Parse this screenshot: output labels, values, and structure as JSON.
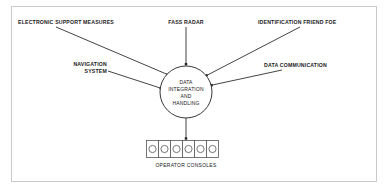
{
  "frame": {
    "border_color": "#c9c9c9",
    "background": "#ffffff"
  },
  "diagram": {
    "type": "system-block-diagram",
    "line_color": "#222222",
    "text_color": "#1a1a1a",
    "hub": {
      "label_lines": [
        "DATA",
        "INTEGRATION",
        "AND",
        "HANDLING"
      ],
      "shape": "circle"
    },
    "inputs": [
      {
        "id": "esm",
        "label": "ELECTRONIC SUPPORT MEASURES",
        "position": "top-left",
        "arrow_into_hub": true
      },
      {
        "id": "fass",
        "label": "FASS RADAR",
        "position": "top-center",
        "arrow_into_hub": true
      },
      {
        "id": "iff",
        "label": "IDENTIFICATION FRIEND FOE",
        "position": "top-right",
        "arrow_into_hub": true
      },
      {
        "id": "nav",
        "label_lines": [
          "NAVIGATION",
          "SYSTEM"
        ],
        "label": "NAVIGATION SYSTEM",
        "position": "middle-left",
        "arrow_into_hub": true
      },
      {
        "id": "datcom",
        "label": "DATA COMMUNICATION",
        "position": "middle-right",
        "arrow_into_hub": true
      }
    ],
    "output": {
      "id": "consoles",
      "label": "OPERATOR CONSOLES",
      "count": 6,
      "arrow_from_hub": true
    }
  }
}
